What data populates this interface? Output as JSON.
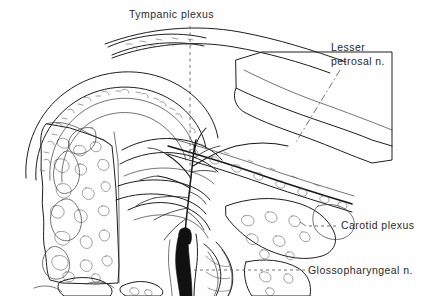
{
  "figure": {
    "type": "anatomical-line-drawing",
    "subject": "Tympanic plexus",
    "style": "black-and-white pen-and-ink medical illustration",
    "width": 430,
    "height": 296,
    "background_color": "#fefefe",
    "ink_color": "#1a1a1a",
    "label_color": "#2a2a2a"
  },
  "labels": {
    "tympanic_plexus": {
      "text": "Tympanic plexus",
      "lines": [
        "Tympanic plexus"
      ],
      "leader": "vertical-dashed",
      "position": "top-center"
    },
    "lesser_petrosal": {
      "text": "Lesser petrosal n.",
      "lines": [
        "Lesser",
        "petrosal n."
      ],
      "leader": "diagonal-dash-dot",
      "position": "top-right"
    },
    "carotid_plexus": {
      "text": "Carotid plexus",
      "lines": [
        "Carotid plexus"
      ],
      "leader": "horizontal-dashed",
      "position": "right"
    },
    "glossopharyngeal": {
      "text": "Glossopharyngeal n.",
      "lines": [
        "Glossopharyngeal n."
      ],
      "leader": "horizontal-dashed",
      "position": "bottom-right"
    }
  },
  "structures": [
    {
      "name": "cancellous-bone-left",
      "description": "trabecular bone with stippled marrow spaces, left margin"
    },
    {
      "name": "petrous-temporal-bone",
      "description": "large bone block upper right"
    },
    {
      "name": "carotid-canal",
      "description": "channel containing internal carotid artery"
    },
    {
      "name": "tympanic-nerve-branches",
      "description": "fine branching nerve plexus, center"
    },
    {
      "name": "glossopharyngeal-trunk",
      "description": "thick dark nerve trunk descending at bottom center"
    },
    {
      "name": "eustachian-tube",
      "description": "tubal structure lower center"
    }
  ]
}
